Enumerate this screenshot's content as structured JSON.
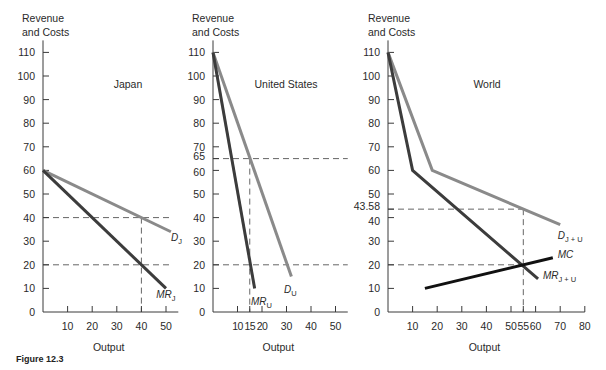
{
  "figure_caption": "Figure 12.3",
  "colors": {
    "axis": "#3a3a3a",
    "demand": "#8a8a8a",
    "mr": "#3c3c3c",
    "mc": "#111111",
    "dash": "#555555",
    "text": "#2a2a2a"
  },
  "chart_data": [
    {
      "type": "line",
      "title": "Japan",
      "xlabel": "Output",
      "ylabel": "Revenue and Costs",
      "xlim": [
        0,
        55
      ],
      "ylim": [
        0,
        110
      ],
      "xticks": [
        10,
        20,
        30,
        40,
        50
      ],
      "yticks": [
        0,
        10,
        20,
        30,
        40,
        50,
        60,
        70,
        80,
        90,
        100,
        110
      ],
      "series": [
        {
          "name": "D_J",
          "label": "D",
          "sub": "J",
          "style": "demand",
          "points": [
            [
              0,
              60
            ],
            [
              52,
              34
            ]
          ]
        },
        {
          "name": "MR_J",
          "label": "MR",
          "sub": "J",
          "style": "mr",
          "points": [
            [
              0,
              60
            ],
            [
              50,
              10
            ]
          ]
        }
      ],
      "guides": {
        "h": [
          40,
          20
        ],
        "v": [
          40
        ],
        "h_extent": 52
      },
      "label_pos": {
        "D_J": [
          52,
          30
        ],
        "MR_J": [
          46,
          6
        ]
      }
    },
    {
      "type": "line",
      "title": "United States",
      "xlabel": "Output",
      "ylabel": "Revenue and Costs",
      "xlim": [
        0,
        55
      ],
      "ylim": [
        0,
        110
      ],
      "xticks": [
        10,
        15,
        20,
        30,
        40,
        50
      ],
      "xtick_labels": [
        "10",
        "15",
        "20",
        "30",
        "40",
        "50"
      ],
      "yticks": [
        0,
        10,
        20,
        30,
        40,
        50,
        60,
        65,
        70,
        80,
        90,
        100,
        110
      ],
      "series": [
        {
          "name": "D_U",
          "label": "D",
          "sub": "U",
          "style": "demand",
          "points": [
            [
              0,
              110
            ],
            [
              32,
              15
            ]
          ]
        },
        {
          "name": "MR_U",
          "label": "MR",
          "sub": "U",
          "style": "mr",
          "points": [
            [
              0,
              110
            ],
            [
              17,
              10
            ]
          ]
        }
      ],
      "guides": {
        "h": [
          65,
          20
        ],
        "v": [
          15
        ],
        "h_extent": 55
      },
      "label_pos": {
        "D_U": [
          29,
          8
        ],
        "MR_U": [
          15.5,
          3
        ]
      }
    },
    {
      "type": "line",
      "title": "World",
      "xlabel": "Output",
      "ylabel": "Revenue and Costs",
      "xlim": [
        0,
        80
      ],
      "ylim": [
        0,
        110
      ],
      "xticks": [
        10,
        20,
        30,
        40,
        50,
        55,
        60,
        70,
        80
      ],
      "yticks": [
        0,
        10,
        20,
        30,
        40,
        43.58,
        50,
        60,
        70,
        80,
        90,
        100,
        110
      ],
      "series": [
        {
          "name": "D_J+U",
          "label": "D",
          "sub": "J + U",
          "style": "demand",
          "points": [
            [
              0,
              110
            ],
            [
              18,
              60
            ],
            [
              70,
              37
            ]
          ]
        },
        {
          "name": "MR_J+U",
          "label": "MR",
          "sub": "J + U",
          "style": "mr",
          "points": [
            [
              0,
              110
            ],
            [
              10,
              60
            ],
            [
              61,
              14
            ]
          ]
        },
        {
          "name": "MC",
          "label": "MC",
          "sub": "",
          "style": "mc",
          "points": [
            [
              15,
              10
            ],
            [
              67,
              23
            ]
          ]
        }
      ],
      "guides": {
        "h": [
          43.58,
          20
        ],
        "v": [
          55
        ],
        "h_extent": 55
      },
      "label_pos": {
        "D_J+U": [
          69,
          31
        ],
        "MR_J+U": [
          63,
          14
        ],
        "MC": [
          69,
          23
        ]
      }
    }
  ],
  "panels": [
    {
      "origin": [
        43,
        312
      ],
      "xscale": 2.46,
      "yscale": 2.36,
      "title_pos": [
        128,
        88
      ],
      "ylabel_pos": [
        22,
        22
      ]
    },
    {
      "origin": [
        213,
        312
      ],
      "xscale": 2.45,
      "yscale": 2.36,
      "title_pos": [
        286,
        88
      ],
      "ylabel_pos": [
        192,
        22
      ]
    },
    {
      "origin": [
        388,
        312
      ],
      "xscale": 2.46,
      "yscale": 2.36,
      "title_pos": [
        487,
        88
      ],
      "ylabel_pos": [
        368,
        22
      ]
    }
  ],
  "ylabel_lines": [
    "Revenue",
    "and Costs"
  ]
}
